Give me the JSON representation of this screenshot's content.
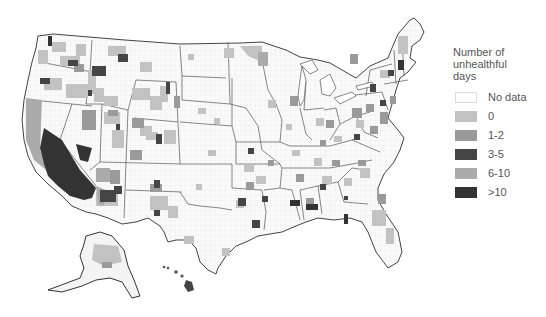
{
  "map": {
    "region": "United States (counties)",
    "description": "County choropleth of number of unhealthful days",
    "colors": {
      "background": "#ffffff",
      "state_border": "#555555",
      "county_border": "#e0e0e0",
      "land": "#f7f7f7"
    }
  },
  "legend": {
    "title_lines": [
      "Number of",
      "unhealthful",
      "days"
    ],
    "items": [
      {
        "label": "No data",
        "color": "#ffffff"
      },
      {
        "label": "0",
        "color": "#c2c2c2"
      },
      {
        "label": "1-2",
        "color": "#9a9a9a"
      },
      {
        "label": "3-5",
        "color": "#454545"
      },
      {
        "label": "6-10",
        "color": "#ababab"
      },
      {
        "label": ">10",
        "color": "#333333"
      }
    ]
  }
}
